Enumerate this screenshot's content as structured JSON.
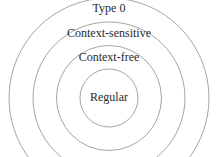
{
  "diagram": {
    "type": "nested-circles",
    "stroke_color": "#9a9a9a",
    "text_color": "#2a2a2a",
    "levels": [
      {
        "label": "Type 0",
        "level": "outer"
      },
      {
        "label": "Context-sensitive",
        "level": "third"
      },
      {
        "label": "Context-free",
        "level": "second"
      },
      {
        "label": "Regular",
        "level": "inner"
      }
    ]
  }
}
